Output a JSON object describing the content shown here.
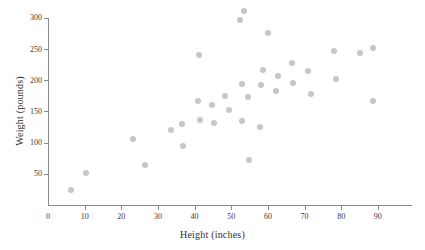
{
  "chart_data": {
    "type": "scatter",
    "title": "",
    "xlabel": "Height (inches)",
    "ylabel": "Weight (pounds)",
    "xlim": [
      0,
      99
    ],
    "ylim": [
      0,
      303
    ],
    "xticks": [
      0,
      10,
      20,
      30,
      40,
      50,
      60,
      70,
      80,
      90
    ],
    "yticks": [
      50,
      100,
      150,
      200,
      250,
      300
    ],
    "xtick_labels": [
      "0",
      "10",
      "20",
      "30",
      "40",
      "50",
      "60",
      "70",
      "80",
      "90"
    ],
    "ytick_labels": [
      "50",
      "100",
      "150",
      "200",
      "250",
      "300"
    ],
    "grid": false,
    "legend": false,
    "marker_color": "#c6c6c6",
    "axis_color": "#8a8a8a",
    "series": [
      {
        "name": "observations",
        "x": [
          6.3,
          10.4,
          23.2,
          26.6,
          33.5,
          36.8,
          36.6,
          41.0,
          41.3,
          41.5,
          44.7,
          45.2,
          48.2,
          49.5,
          52.3,
          52.5,
          53.0,
          53.4,
          53.8,
          54.8,
          55.2,
          57.8,
          58.2,
          58.8,
          60.0,
          60.3,
          62.5,
          63.2,
          66.6,
          67.0,
          71.0,
          71.5,
          78.0,
          78.3,
          85.0,
          88.6,
          88.8
        ],
        "y": [
          24,
          52,
          105,
          64,
          120,
          95,
          130,
          166,
          241,
          137,
          161,
          131,
          174,
          152,
          296,
          135,
          194,
          311,
          173,
          72,
          125,
          193,
          216,
          266,
          183,
          206,
          227,
          196,
          215,
          178,
          247,
          202,
          244,
          251,
          166,
          0,
          0
        ]
      }
    ],
    "points": [
      {
        "x": 6.3,
        "y": 24
      },
      {
        "x": 10.4,
        "y": 52
      },
      {
        "x": 23.2,
        "y": 105
      },
      {
        "x": 26.6,
        "y": 64
      },
      {
        "x": 33.5,
        "y": 120
      },
      {
        "x": 36.8,
        "y": 95
      },
      {
        "x": 36.6,
        "y": 130
      },
      {
        "x": 41.0,
        "y": 166
      },
      {
        "x": 41.3,
        "y": 241
      },
      {
        "x": 41.5,
        "y": 137
      },
      {
        "x": 44.7,
        "y": 161
      },
      {
        "x": 45.2,
        "y": 131
      },
      {
        "x": 48.2,
        "y": 174
      },
      {
        "x": 49.5,
        "y": 152
      },
      {
        "x": 52.3,
        "y": 296
      },
      {
        "x": 52.8,
        "y": 135
      },
      {
        "x": 53.0,
        "y": 194
      },
      {
        "x": 53.4,
        "y": 311
      },
      {
        "x": 54.5,
        "y": 173
      },
      {
        "x": 54.8,
        "y": 72
      },
      {
        "x": 57.8,
        "y": 125
      },
      {
        "x": 58.0,
        "y": 193
      },
      {
        "x": 58.6,
        "y": 216
      },
      {
        "x": 60.0,
        "y": 275
      },
      {
        "x": 62.3,
        "y": 183
      },
      {
        "x": 62.8,
        "y": 206
      },
      {
        "x": 66.5,
        "y": 227
      },
      {
        "x": 66.8,
        "y": 196
      },
      {
        "x": 71.0,
        "y": 215
      },
      {
        "x": 71.8,
        "y": 178
      },
      {
        "x": 78.0,
        "y": 247
      },
      {
        "x": 78.5,
        "y": 202
      },
      {
        "x": 85.0,
        "y": 244
      },
      {
        "x": 88.8,
        "y": 251
      },
      {
        "x": 88.6,
        "y": 166
      }
    ]
  }
}
